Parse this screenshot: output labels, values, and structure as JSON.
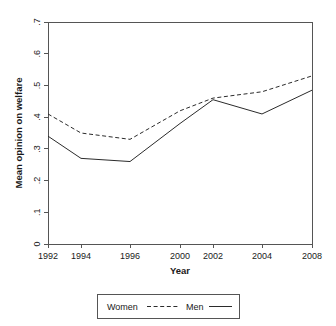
{
  "chart_data": {
    "type": "line",
    "title": "",
    "xlabel": "Year",
    "ylabel": "Mean opinion on welfare",
    "x": [
      1992,
      1994,
      1996,
      2000,
      2002,
      2004,
      2008
    ],
    "xtick_labels": [
      "1992",
      "1994",
      "1996",
      "2000",
      "2002",
      "2004",
      "2008"
    ],
    "ytick_labels": [
      "0",
      ".1",
      ".2",
      ".3",
      ".4",
      ".5",
      ".6",
      ".7"
    ],
    "ytick_values": [
      0,
      0.1,
      0.2,
      0.3,
      0.4,
      0.5,
      0.6,
      0.7
    ],
    "xlim": [
      1992,
      2008
    ],
    "ylim": [
      0,
      0.7
    ],
    "grid": false,
    "legend_position": "bottom-center",
    "series": [
      {
        "name": "Women",
        "style": "dashed",
        "color": "#2b2b2b",
        "values": [
          0.41,
          0.35,
          0.33,
          0.42,
          0.46,
          0.48,
          0.53
        ]
      },
      {
        "name": "Men",
        "style": "solid",
        "color": "#2b2b2b",
        "values": [
          0.34,
          0.27,
          0.26,
          0.38,
          0.455,
          0.41,
          0.485
        ]
      }
    ]
  },
  "legend": {
    "entries": [
      {
        "label": "Women",
        "style": "dashed"
      },
      {
        "label": "Men",
        "style": "solid"
      }
    ]
  }
}
